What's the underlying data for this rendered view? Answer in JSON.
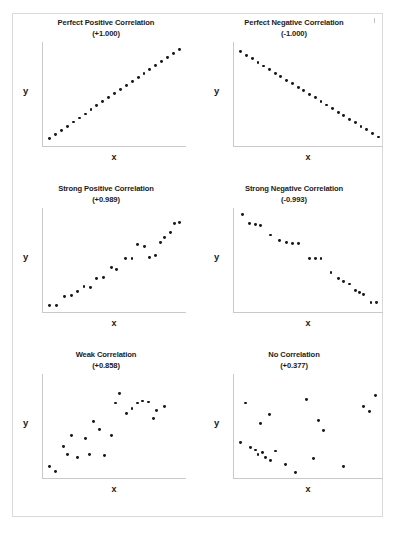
{
  "figure": {
    "axis_label_x": "x",
    "axis_label_y": "y",
    "frame_color": "#d9d9d9",
    "dot_color": "#17171a",
    "axis_color": "#c9c9c9",
    "text_color": "#1b1b1b"
  },
  "chart_data": [
    {
      "type": "scatter",
      "title": "Perfect Positive Correlation",
      "subtitle": "(+1.000)",
      "correlation": 1.0,
      "xlabel": "x",
      "ylabel": "y",
      "xlim": [
        0,
        100
      ],
      "ylim": [
        0,
        100
      ],
      "grid": false,
      "legend": "none",
      "points": [
        [
          2,
          4
        ],
        [
          6.3,
          8.2
        ],
        [
          10.6,
          12.4
        ],
        [
          14.9,
          16.6
        ],
        [
          19.2,
          20.8
        ],
        [
          23.5,
          25.0
        ],
        [
          27.8,
          29.2
        ],
        [
          32.1,
          33.4
        ],
        [
          36.4,
          37.6
        ],
        [
          40.7,
          41.8
        ],
        [
          45.0,
          46.0
        ],
        [
          49.3,
          50.2
        ],
        [
          53.6,
          54.4
        ],
        [
          57.9,
          58.6
        ],
        [
          62.2,
          62.8
        ],
        [
          66.5,
          67.0
        ],
        [
          70.8,
          71.2
        ],
        [
          75.1,
          75.4
        ],
        [
          79.4,
          79.6
        ],
        [
          83.7,
          83.8
        ],
        [
          88.0,
          88.0
        ],
        [
          92.3,
          92.2
        ],
        [
          96.6,
          96.4
        ]
      ]
    },
    {
      "type": "scatter",
      "title": "Perfect Negative Correlation",
      "subtitle": "(-1.000)",
      "correlation": -1.0,
      "xlabel": "x",
      "ylabel": "y",
      "xlim": [
        0,
        100
      ],
      "ylim": [
        0,
        100
      ],
      "grid": false,
      "legend": "none",
      "points": [
        [
          2,
          94
        ],
        [
          6.0,
          90.3
        ],
        [
          10.0,
          86.6
        ],
        [
          14.0,
          82.9
        ],
        [
          18.0,
          79.2
        ],
        [
          22.0,
          75.5
        ],
        [
          26.0,
          71.8
        ],
        [
          30.0,
          68.1
        ],
        [
          34.0,
          64.4
        ],
        [
          38.0,
          60.7
        ],
        [
          42.0,
          57.0
        ],
        [
          46.0,
          53.3
        ],
        [
          50.0,
          49.6
        ],
        [
          54.0,
          45.9
        ],
        [
          58.0,
          42.2
        ],
        [
          62.0,
          38.5
        ],
        [
          66.0,
          34.8
        ],
        [
          70.0,
          31.1
        ],
        [
          74.0,
          27.4
        ],
        [
          78.0,
          23.7
        ],
        [
          82.0,
          20.0
        ],
        [
          86.0,
          16.3
        ],
        [
          90.0,
          12.6
        ],
        [
          94.0,
          8.9
        ],
        [
          98.0,
          5.2
        ]
      ]
    },
    {
      "type": "scatter",
      "title": "Strong Positive Correlation",
      "subtitle": "(+0.989)",
      "correlation": 0.989,
      "xlabel": "x",
      "ylabel": "y",
      "xlim": [
        0,
        100
      ],
      "ylim": [
        0,
        100
      ],
      "grid": false,
      "legend": "none",
      "points": [
        [
          2,
          3
        ],
        [
          7,
          3
        ],
        [
          13,
          12
        ],
        [
          18,
          13
        ],
        [
          22,
          17
        ],
        [
          27,
          22
        ],
        [
          32,
          21
        ],
        [
          36,
          31
        ],
        [
          41,
          32
        ],
        [
          47,
          42
        ],
        [
          51,
          40
        ],
        [
          57,
          52
        ],
        [
          62,
          52
        ],
        [
          66,
          66
        ],
        [
          71,
          64
        ],
        [
          75,
          53
        ],
        [
          79,
          55
        ],
        [
          83,
          68
        ],
        [
          86,
          73
        ],
        [
          90,
          79
        ],
        [
          93,
          88
        ],
        [
          97,
          89
        ]
      ]
    },
    {
      "type": "scatter",
      "title": "Strong Negative Correlation",
      "subtitle": "(-0.993)",
      "correlation": -0.993,
      "xlabel": "x",
      "ylabel": "y",
      "xlim": [
        0,
        100
      ],
      "ylim": [
        0,
        100
      ],
      "grid": false,
      "legend": "none",
      "points": [
        [
          3,
          97
        ],
        [
          8,
          88
        ],
        [
          12,
          87
        ],
        [
          16,
          86
        ],
        [
          23,
          76
        ],
        [
          29,
          70
        ],
        [
          34,
          68
        ],
        [
          38,
          67
        ],
        [
          42,
          67
        ],
        [
          50,
          52
        ],
        [
          54,
          52
        ],
        [
          58,
          52
        ],
        [
          65,
          37
        ],
        [
          70,
          31
        ],
        [
          74,
          28
        ],
        [
          78,
          25
        ],
        [
          82,
          18
        ],
        [
          85,
          16
        ],
        [
          88,
          14
        ],
        [
          93,
          6
        ],
        [
          97,
          6
        ]
      ]
    },
    {
      "type": "scatter",
      "title": "Weak Correlation",
      "subtitle": "(+0.858)",
      "correlation": 0.858,
      "xlabel": "x",
      "ylabel": "y",
      "xlim": [
        0,
        100
      ],
      "ylim": [
        0,
        100
      ],
      "grid": false,
      "legend": "none",
      "points": [
        [
          2,
          8
        ],
        [
          6,
          3
        ],
        [
          12,
          29
        ],
        [
          15,
          20
        ],
        [
          18,
          40
        ],
        [
          22,
          17
        ],
        [
          28,
          37
        ],
        [
          31,
          20
        ],
        [
          34,
          55
        ],
        [
          38,
          46
        ],
        [
          42,
          19
        ],
        [
          47,
          40
        ],
        [
          50,
          74
        ],
        [
          53,
          84
        ],
        [
          58,
          63
        ],
        [
          62,
          68
        ],
        [
          66,
          74
        ],
        [
          70,
          76
        ],
        [
          74,
          75
        ],
        [
          78,
          58
        ],
        [
          80,
          66
        ],
        [
          86,
          70
        ]
      ]
    },
    {
      "type": "scatter",
      "title": "No Correlation",
      "subtitle": "(+0.377)",
      "correlation": 0.377,
      "xlabel": "x",
      "ylabel": "y",
      "xlim": [
        0,
        100
      ],
      "ylim": [
        0,
        100
      ],
      "grid": false,
      "legend": "none",
      "points": [
        [
          2,
          33
        ],
        [
          5,
          74
        ],
        [
          9,
          28
        ],
        [
          12,
          25
        ],
        [
          14,
          20
        ],
        [
          16,
          53
        ],
        [
          17,
          22
        ],
        [
          19,
          17
        ],
        [
          22,
          62
        ],
        [
          23,
          14
        ],
        [
          26,
          24
        ],
        [
          33,
          10
        ],
        [
          40,
          2
        ],
        [
          48,
          78
        ],
        [
          53,
          16
        ],
        [
          56,
          56
        ],
        [
          60,
          45
        ],
        [
          74,
          8
        ],
        [
          88,
          70
        ],
        [
          92,
          65
        ],
        [
          96,
          82
        ]
      ]
    }
  ]
}
